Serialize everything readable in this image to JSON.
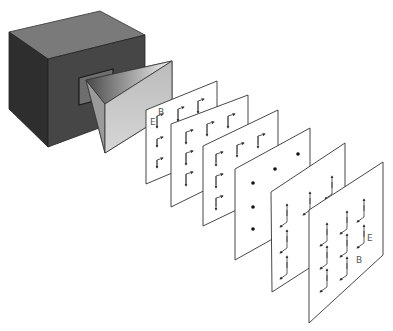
{
  "diagram": {
    "type": "electromagnetic-wave-propagation",
    "source": {
      "name": "microwave-source-box",
      "horn": "horn-antenna"
    },
    "labels": {
      "first_panel_E": "E",
      "first_panel_B": "B",
      "last_panel_E": "E",
      "last_panel_B": "B"
    },
    "panels": [
      {
        "index": 1,
        "field": "E down, B right",
        "rows": 3,
        "cols": 3
      },
      {
        "index": 2,
        "field": "E down, B right",
        "rows": 3,
        "cols": 3
      },
      {
        "index": 3,
        "field": "E down, B right",
        "rows": 3,
        "cols": 3
      },
      {
        "index": 4,
        "field": "zero (dots)",
        "rows": 3,
        "cols": 3
      },
      {
        "index": 5,
        "field": "E up, B left",
        "rows": 3,
        "cols": 3
      },
      {
        "index": 6,
        "field": "E up, B left",
        "rows": 3,
        "cols": 3
      }
    ]
  }
}
